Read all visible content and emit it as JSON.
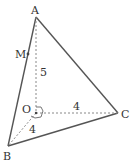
{
  "diagram": {
    "points": {
      "A": {
        "label": "A",
        "x": 36,
        "y": 17
      },
      "M": {
        "label": "M",
        "x": 28,
        "y": 54
      },
      "O": {
        "label": "O",
        "x": 36,
        "y": 113
      },
      "B": {
        "label": "B",
        "x": 8,
        "y": 146
      },
      "C": {
        "label": "C",
        "x": 118,
        "y": 113
      }
    },
    "edge_labels": {
      "OA": "5",
      "OC": "4",
      "OB": "4"
    },
    "colors": {
      "solid_edge": "#555555",
      "dashed_edge": "#888888",
      "text": "#333333"
    }
  }
}
